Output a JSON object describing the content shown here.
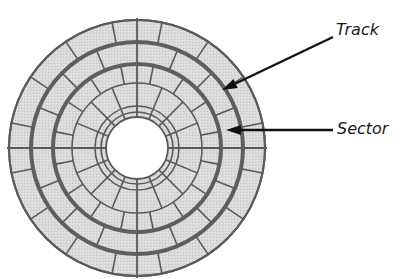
{
  "diagram": {
    "type": "disk-platter",
    "colors": {
      "fill": "#d8d8d8",
      "line": "#5a5a5a",
      "thick_line": "#5e5e5e",
      "hole": "#ffffff",
      "arrow": "#111111",
      "text": "#1a1a1a"
    },
    "center": [
      137,
      148
    ],
    "outer_radius": 128,
    "hole_radius": 31,
    "thin_rings": [
      65,
      42,
      36
    ],
    "thick_rings": [
      106,
      84
    ],
    "inner_sector_count": 16,
    "outer_sector_count": 16
  },
  "labels": {
    "track": "Track",
    "sector": "Sector"
  },
  "arrows": [
    {
      "name": "track-arrow",
      "from": [
        333,
        37
      ],
      "to": [
        222,
        90
      ]
    },
    {
      "name": "sector-arrow",
      "from": [
        333,
        130
      ],
      "to": [
        226,
        130
      ]
    }
  ]
}
